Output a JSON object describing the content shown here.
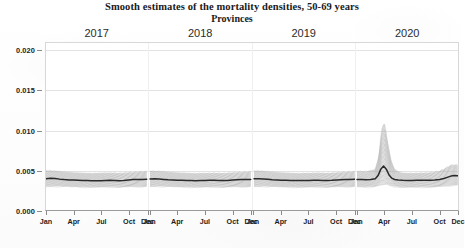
{
  "chart_data": {
    "type": "line",
    "title": "Smooth estimates of the mortality densities, 50-69 years",
    "subtitle": "Provinces",
    "xlabel": "",
    "ylabel": "",
    "ylim": [
      0.0,
      0.021
    ],
    "yticks": [
      "0.000",
      "0.005",
      "0.010",
      "0.015",
      "0.020"
    ],
    "ytick_values": [
      0.0,
      0.005,
      0.01,
      0.015,
      0.02
    ],
    "grid": true,
    "legend": "none",
    "facet_labels": [
      "2017",
      "2018",
      "2019",
      "2020"
    ],
    "xtick_labels": [
      "Jan",
      "Apr",
      "Jul",
      "Oct",
      "Dec"
    ],
    "xtick_months": [
      1,
      4,
      7,
      10,
      12
    ],
    "band_color": "#b4b4b4",
    "line_color": "#2a2a2a",
    "grid_color": "#e3e3e3",
    "series": [
      {
        "name": "2017 median",
        "facet": "2017",
        "x": [
          1,
          1.5,
          2,
          2.5,
          3,
          3.5,
          4,
          4.5,
          5,
          5.5,
          6,
          6.5,
          7,
          7.5,
          8,
          8.5,
          9,
          9.5,
          10,
          10.5,
          11,
          11.5,
          12
        ],
        "values": [
          0.004,
          0.00408,
          0.00405,
          0.00396,
          0.0039,
          0.00386,
          0.00384,
          0.00383,
          0.0038,
          0.00378,
          0.00376,
          0.00375,
          0.00377,
          0.0038,
          0.00382,
          0.00379,
          0.00376,
          0.0038,
          0.00386,
          0.0039,
          0.00391,
          0.00392,
          0.00394
        ]
      },
      {
        "name": "2017 band upper",
        "facet": "2017",
        "x": [
          1,
          2,
          3,
          4,
          5,
          6,
          7,
          8,
          9,
          10,
          11,
          12
        ],
        "values": [
          0.00505,
          0.005,
          0.00488,
          0.0048,
          0.00474,
          0.0047,
          0.00474,
          0.00476,
          0.00472,
          0.0048,
          0.00486,
          0.00492
        ]
      },
      {
        "name": "2017 band lower",
        "facet": "2017",
        "x": [
          1,
          2,
          3,
          4,
          5,
          6,
          7,
          8,
          9,
          10,
          11,
          12
        ],
        "values": [
          0.003,
          0.00305,
          0.00302,
          0.00298,
          0.00294,
          0.00292,
          0.00294,
          0.00296,
          0.00293,
          0.00296,
          0.003,
          0.00303
        ]
      },
      {
        "name": "2018 median",
        "facet": "2018",
        "x": [
          1,
          1.5,
          2,
          2.5,
          3,
          3.5,
          4,
          4.5,
          5,
          5.5,
          6,
          6.5,
          7,
          7.5,
          8,
          8.5,
          9,
          9.5,
          10,
          10.5,
          11,
          11.5,
          12
        ],
        "values": [
          0.00398,
          0.004,
          0.00398,
          0.00392,
          0.00387,
          0.00384,
          0.00382,
          0.00381,
          0.0038,
          0.00378,
          0.00377,
          0.00378,
          0.0038,
          0.00381,
          0.00381,
          0.00379,
          0.00378,
          0.0038,
          0.00384,
          0.00388,
          0.0039,
          0.00391,
          0.00392
        ]
      },
      {
        "name": "2018 band upper",
        "facet": "2018",
        "x": [
          1,
          2,
          3,
          4,
          5,
          6,
          7,
          8,
          9,
          10,
          11,
          12
        ],
        "values": [
          0.005,
          0.00496,
          0.00486,
          0.00478,
          0.00473,
          0.0047,
          0.00472,
          0.00474,
          0.00471,
          0.00478,
          0.00484,
          0.0049
        ]
      },
      {
        "name": "2018 band lower",
        "facet": "2018",
        "x": [
          1,
          2,
          3,
          4,
          5,
          6,
          7,
          8,
          9,
          10,
          11,
          12
        ],
        "values": [
          0.00301,
          0.00304,
          0.00301,
          0.00297,
          0.00294,
          0.00292,
          0.00294,
          0.00295,
          0.00293,
          0.00296,
          0.00299,
          0.00302
        ]
      },
      {
        "name": "2019 median",
        "facet": "2019",
        "x": [
          1,
          1.5,
          2,
          2.5,
          3,
          3.5,
          4,
          4.5,
          5,
          5.5,
          6,
          6.5,
          7,
          7.5,
          8,
          8.5,
          9,
          9.5,
          10,
          10.5,
          11,
          11.5,
          12
        ],
        "values": [
          0.004,
          0.00402,
          0.00399,
          0.00393,
          0.00388,
          0.00385,
          0.00383,
          0.00382,
          0.0038,
          0.00379,
          0.00378,
          0.00378,
          0.0038,
          0.00382,
          0.00382,
          0.0038,
          0.00379,
          0.00381,
          0.00385,
          0.00388,
          0.0039,
          0.00392,
          0.00394
        ]
      },
      {
        "name": "2019 band upper",
        "facet": "2019",
        "x": [
          1,
          2,
          3,
          4,
          5,
          6,
          7,
          8,
          9,
          10,
          11,
          12
        ],
        "values": [
          0.00502,
          0.00498,
          0.00487,
          0.00479,
          0.00473,
          0.0047,
          0.00473,
          0.00475,
          0.00472,
          0.00478,
          0.00485,
          0.00491
        ]
      },
      {
        "name": "2019 band lower",
        "facet": "2019",
        "x": [
          1,
          2,
          3,
          4,
          5,
          6,
          7,
          8,
          9,
          10,
          11,
          12
        ],
        "values": [
          0.003,
          0.00304,
          0.00301,
          0.00297,
          0.00294,
          0.00292,
          0.00294,
          0.00296,
          0.00293,
          0.00296,
          0.003,
          0.00303
        ]
      },
      {
        "name": "2020 median",
        "facet": "2020",
        "x": [
          1,
          1.5,
          2,
          2.5,
          3,
          3.3,
          3.6,
          3.9,
          4.2,
          4.5,
          4.8,
          5.1,
          5.5,
          6,
          6.5,
          7,
          7.5,
          8,
          8.5,
          9,
          9.5,
          10,
          10.5,
          11,
          11.3,
          11.6,
          12
        ],
        "values": [
          0.00392,
          0.0039,
          0.00388,
          0.0039,
          0.004,
          0.0044,
          0.0052,
          0.0056,
          0.0052,
          0.00448,
          0.00408,
          0.00392,
          0.00386,
          0.00382,
          0.0038,
          0.0038,
          0.00382,
          0.00382,
          0.00381,
          0.00382,
          0.00386,
          0.00392,
          0.00404,
          0.00424,
          0.00436,
          0.0044,
          0.00438
        ]
      },
      {
        "name": "2020 band upper",
        "facet": "2020",
        "x": [
          1,
          2,
          3,
          3.4,
          3.7,
          4.0,
          4.3,
          4.7,
          5.1,
          5.6,
          6,
          7,
          8,
          9,
          10,
          10.6,
          11.2,
          11.7,
          12
        ],
        "values": [
          0.00496,
          0.00492,
          0.0052,
          0.007,
          0.0104,
          0.011,
          0.009,
          0.0064,
          0.0052,
          0.00486,
          0.00474,
          0.00472,
          0.00474,
          0.00478,
          0.00496,
          0.0053,
          0.0057,
          0.0058,
          0.0057
        ]
      },
      {
        "name": "2020 band lower",
        "facet": "2020",
        "x": [
          1,
          2,
          3,
          3.7,
          4.2,
          4.8,
          5.5,
          6,
          7,
          8,
          9,
          10,
          11,
          11.6,
          12
        ],
        "values": [
          0.00298,
          0.00296,
          0.003,
          0.00322,
          0.00326,
          0.00308,
          0.00296,
          0.00292,
          0.00292,
          0.00294,
          0.00294,
          0.00298,
          0.00312,
          0.00322,
          0.0032
        ]
      }
    ]
  }
}
